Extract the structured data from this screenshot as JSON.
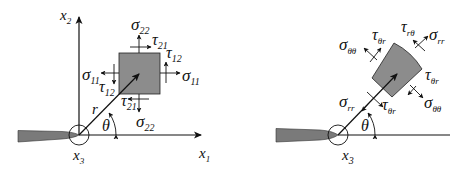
{
  "figure": {
    "colors": {
      "ink": "#111111",
      "element_fill": "#8c8c8c",
      "crack_fill": "#7a7a7a",
      "background": "#ffffff"
    },
    "left_panel": {
      "title": "Cartesian stress components at crack tip",
      "axis_x1": {
        "sym": "x",
        "sub": "1"
      },
      "axis_x2": {
        "sym": "x",
        "sub": "2"
      },
      "axis_x3": {
        "sym": "x",
        "sub": "3"
      },
      "radius": {
        "sym": "r"
      },
      "angle": {
        "sym": "θ"
      },
      "stresses": {
        "sigma22_top": {
          "sym": "σ",
          "sub": "22"
        },
        "tau21_top": {
          "sym": "τ",
          "sub": "21"
        },
        "tau12_right": {
          "sym": "τ",
          "sub": "12"
        },
        "sigma11_right": {
          "sym": "σ",
          "sub": "11"
        },
        "sigma11_left": {
          "sym": "σ",
          "sub": "11"
        },
        "tau12_left": {
          "sym": "τ",
          "sub": "12"
        },
        "tau21_bottom": {
          "sym": "τ",
          "sub": "21"
        },
        "sigma22_bottom": {
          "sym": "σ",
          "sub": "22"
        }
      }
    },
    "right_panel": {
      "title": "Polar stress components at crack tip",
      "axis_x3": {
        "sym": "x",
        "sub": "3"
      },
      "angle": {
        "sym": "θ"
      },
      "stresses": {
        "sigma_thth_left": {
          "sym": "σ",
          "sub": "θθ"
        },
        "tau_thr_top": {
          "sym": "τ",
          "sub": "θr"
        },
        "tau_rth_top": {
          "sym": "τ",
          "sub": "rθ"
        },
        "sigma_rr_top": {
          "sym": "σ",
          "sub": "rr"
        },
        "tau_thr_right": {
          "sym": "τ",
          "sub": "θr"
        },
        "sigma_thth_right": {
          "sym": "σ",
          "sub": "θθ"
        },
        "sigma_rr_bottom": {
          "sym": "σ",
          "sub": "rr"
        },
        "tau_thr_bottom": {
          "sym": "τ",
          "sub": "θr"
        }
      }
    }
  }
}
